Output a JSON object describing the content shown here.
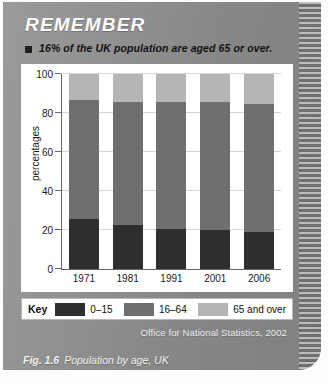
{
  "panel": {
    "title": "REMEMBER",
    "bullet": "16% of the UK population are aged 65 or over.",
    "bullet_icon": "square-bullet-icon",
    "source": "Office for National Statistics, 2002",
    "caption_prefix": "Fig. 1.6",
    "caption_text": "Population by age, UK"
  },
  "legend": {
    "key_label": "Key",
    "items": [
      {
        "label": "0–15",
        "color": "#2e2e2e"
      },
      {
        "label": "16–64",
        "color": "#6f6f6f"
      },
      {
        "label": "65 and over",
        "color": "#b5b5b5"
      }
    ]
  },
  "chart_data": {
    "type": "bar",
    "subtype": "stacked-bar",
    "title": "Population by age, UK",
    "xlabel": "",
    "ylabel": "percentages",
    "categories": [
      "1971",
      "1981",
      "1991",
      "2001",
      "2006"
    ],
    "ylim": [
      0,
      100
    ],
    "yticks": [
      0,
      20,
      40,
      60,
      80,
      100
    ],
    "ytick_labels": [
      "0",
      "20",
      "40",
      "60",
      "80",
      "100"
    ],
    "grid": true,
    "legend_position": "bottom",
    "series": [
      {
        "name": "0–15",
        "color": "#2e2e2e",
        "values": [
          25.5,
          22.5,
          20.5,
          20.0,
          19.0
        ]
      },
      {
        "name": "16–64",
        "color": "#6f6f6f",
        "values": [
          61.0,
          63.0,
          65.0,
          65.5,
          65.5
        ]
      },
      {
        "name": "65 and over",
        "color": "#b5b5b5",
        "values": [
          13.5,
          14.5,
          14.5,
          14.5,
          15.5
        ]
      }
    ],
    "totals": [
      100,
      100,
      100,
      100,
      100
    ],
    "source": "Office for National Statistics, 2002"
  }
}
